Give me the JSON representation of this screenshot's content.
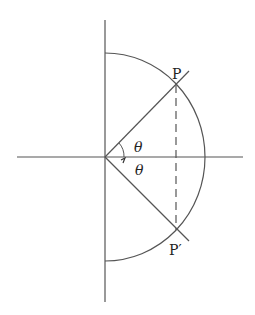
{
  "diagram": {
    "type": "geometry",
    "colors": {
      "stroke": "#555555",
      "text": "#222222",
      "background": "#ffffff"
    },
    "labels": {
      "point_top": "P",
      "point_bottom": "P′",
      "angle_top": "θ",
      "angle_bottom": "θ"
    }
  }
}
